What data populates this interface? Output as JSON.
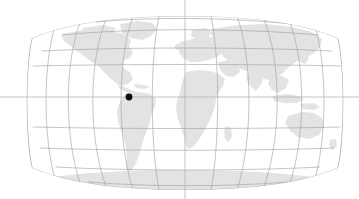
{
  "figure": {
    "width": 359,
    "height": 199,
    "background_color": "#ffffff",
    "projection": "robinson"
  },
  "chart_data": {
    "type": "map",
    "xlabel": "",
    "ylabel": "",
    "projection": "robinson",
    "axis_ranges": {
      "longitude": [
        -180,
        180
      ],
      "latitude": [
        -90,
        90
      ]
    },
    "grid": true,
    "legend": "none",
    "map_frame": {
      "left_px": 30,
      "right_px": 340,
      "top_px": 16,
      "bottom_px": 190,
      "center_x_px": 185,
      "equator_y_px": 97
    },
    "markers": [
      {
        "name": "location-marker",
        "x_px": 129,
        "y_px": 97,
        "longitude": -68,
        "latitude": 5,
        "radius_px": 3.4,
        "color": "#0d0d0d",
        "label": ""
      }
    ],
    "series": [
      {
        "name": "landmass",
        "fill_color": "#e3e3e3",
        "values": []
      },
      {
        "name": "graticule",
        "stroke_color": "#9d9d9d",
        "values": []
      }
    ]
  },
  "colors": {
    "background": "#ffffff",
    "land": "#e3e3e3",
    "land_light": "#eaeaea",
    "graticule": "#9d9d9d",
    "axis": "#b4b4b4",
    "marker": "#0d0d0d"
  },
  "graticule": {
    "parallels_y_px": [
      16,
      33,
      51,
      66,
      97,
      127,
      148,
      167,
      183
    ],
    "meridians_count": 13,
    "parallel_spacing_deg": 20,
    "meridian_spacing_deg": 30,
    "stroke_width": 0.6
  },
  "axes": {
    "vertical_center_line": {
      "name": "central-meridian-axis",
      "x_px": 185,
      "y1_px": 0,
      "y2_px": 199,
      "color": "#b4b4b4"
    },
    "horizontal_center_line": {
      "name": "equator-axis",
      "y_px": 97,
      "x1_px": 0,
      "x2_px": 359,
      "color": "#b4b4b4"
    }
  },
  "landmasses": [
    {
      "name": "north-america",
      "label": "North America"
    },
    {
      "name": "south-america",
      "label": "South America"
    },
    {
      "name": "greenland",
      "label": "Greenland"
    },
    {
      "name": "eurasia",
      "label": "Eurasia"
    },
    {
      "name": "africa",
      "label": "Africa"
    },
    {
      "name": "australia",
      "label": "Australia"
    },
    {
      "name": "antarctica",
      "label": "Antarctica"
    }
  ]
}
